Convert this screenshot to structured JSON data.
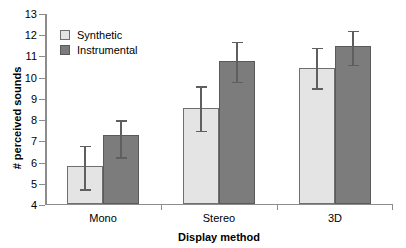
{
  "chart_data": {
    "type": "bar",
    "title": "",
    "xlabel": "Display method",
    "ylabel": "# perceived sounds",
    "categories": [
      "Mono",
      "Stereo",
      "3D"
    ],
    "ylim": [
      4,
      13
    ],
    "yticks": [
      4,
      5,
      6,
      7,
      8,
      9,
      10,
      11,
      12,
      13
    ],
    "ytick_labels": [
      "4",
      "5",
      "6",
      "7",
      "8",
      "9",
      "10",
      "11",
      "12",
      "13"
    ],
    "grid": false,
    "legend_position": "upper-left-inside",
    "series": [
      {
        "name": "Synthetic",
        "color": "#e4e4e4",
        "edge_color": "#6f6f6f",
        "values": [
          5.75,
          8.5,
          10.4
        ],
        "err_low": [
          1.0,
          1.0,
          0.9
        ],
        "err_high": [
          1.05,
          1.1,
          1.0
        ]
      },
      {
        "name": "Instrumental",
        "color": "#7c7c7c",
        "edge_color": "#5a5a5a",
        "values": [
          7.25,
          10.7,
          11.4
        ],
        "err_low": [
          1.0,
          0.9,
          0.8
        ],
        "err_high": [
          0.75,
          1.0,
          0.8
        ]
      }
    ]
  },
  "legend": {
    "items": [
      {
        "label": "Synthetic"
      },
      {
        "label": "Instrumental"
      }
    ]
  }
}
